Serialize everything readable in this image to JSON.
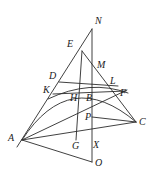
{
  "figure": {
    "name": "geometric-construction-diagram",
    "type": "euclidean-geometry-figure",
    "width": 156,
    "height": 179,
    "background_color": "#ffffff",
    "stroke_color": "#2b2b2b",
    "label_color": "#1a1a1a"
  },
  "points": [
    {
      "id": "N",
      "label": "N",
      "x": 92,
      "y": 29,
      "label_x": 95,
      "label_y": 16
    },
    {
      "id": "E",
      "label": "E",
      "x": 82,
      "y": 51,
      "label_x": 67,
      "label_y": 39
    },
    {
      "id": "M",
      "label": "M",
      "x": 97,
      "y": 69,
      "label_x": 97,
      "label_y": 60
    },
    {
      "id": "D",
      "label": "D",
      "x": 60,
      "y": 82,
      "label_x": 49,
      "label_y": 71
    },
    {
      "id": "L",
      "label": "L",
      "x": 115,
      "y": 86,
      "label_x": 110,
      "label_y": 76
    },
    {
      "id": "K",
      "label": "K",
      "x": 55,
      "y": 93,
      "label_x": 43,
      "label_y": 85
    },
    {
      "id": "H",
      "label": "H",
      "x": 76,
      "y": 92,
      "label_x": 70,
      "label_y": 93
    },
    {
      "id": "B",
      "label": "B",
      "x": 92,
      "y": 92,
      "label_x": 86,
      "label_y": 93
    },
    {
      "id": "F",
      "label": "F",
      "x": 124,
      "y": 92,
      "label_x": 120,
      "label_y": 88
    },
    {
      "id": "P",
      "label": "P",
      "x": 92,
      "y": 117,
      "label_x": 85,
      "label_y": 114
    },
    {
      "id": "C",
      "label": "C",
      "x": 136,
      "y": 122,
      "label_x": 139,
      "label_y": 118
    },
    {
      "id": "A",
      "label": "A",
      "x": 22,
      "y": 140,
      "label_x": 8,
      "label_y": 133
    },
    {
      "id": "G",
      "label": "G",
      "x": 76,
      "y": 138,
      "label_x": 73,
      "label_y": 140
    },
    {
      "id": "X",
      "label": "X",
      "x": 92,
      "y": 138,
      "label_x": 93,
      "label_y": 139
    },
    {
      "id": "O",
      "label": "O",
      "x": 92,
      "y": 162,
      "label_x": 95,
      "label_y": 158
    }
  ],
  "segments": [
    {
      "name": "segment-A-N",
      "from": "A",
      "to": "N"
    },
    {
      "name": "segment-E-C",
      "from": "E",
      "to": "C"
    },
    {
      "name": "segment-N-O",
      "from": "N",
      "to": "O"
    },
    {
      "name": "segment-E-G",
      "from": "E",
      "to": "G"
    },
    {
      "name": "segment-A-C",
      "from": "A",
      "to": "C"
    },
    {
      "name": "segment-A-O",
      "from": "A",
      "to": "O"
    },
    {
      "name": "segment-D-L",
      "from": "D",
      "to": "L"
    },
    {
      "name": "segment-K-F",
      "from": "K",
      "to": "F"
    },
    {
      "name": "segment-P-C",
      "from": "P",
      "to": "C"
    },
    {
      "name": "segment-A-F",
      "from": "A",
      "to": "F"
    }
  ],
  "arcs": [
    {
      "name": "arc-K-B-F",
      "from": "K",
      "to": "F",
      "through": "B"
    },
    {
      "name": "arc-A-B-C",
      "from": "A",
      "to": "C",
      "through": "B"
    }
  ],
  "labels": {
    "N": "N",
    "E": "E",
    "M": "M",
    "D": "D",
    "L": "L",
    "K": "K",
    "H": "H",
    "B": "B",
    "F": "F",
    "P": "P",
    "C": "C",
    "A": "A",
    "G": "G",
    "X": "X",
    "O": "O"
  }
}
